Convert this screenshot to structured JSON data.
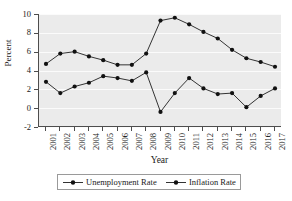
{
  "chart_data": {
    "type": "line",
    "title": "",
    "xlabel": "Year",
    "ylabel": "Percent",
    "categories": [
      "2001",
      "2002",
      "2003",
      "2004",
      "2005",
      "2006",
      "2007",
      "2008",
      "2009",
      "2010",
      "2011",
      "2012",
      "2013",
      "2014",
      "2015",
      "2016",
      "2017"
    ],
    "x": [
      2001,
      2002,
      2003,
      2004,
      2005,
      2006,
      2007,
      2008,
      2009,
      2010,
      2011,
      2012,
      2013,
      2014,
      2015,
      2016,
      2017
    ],
    "series": [
      {
        "name": "Unemployment Rate",
        "color": "#333333",
        "marker": "circle",
        "values": [
          4.7,
          5.8,
          6.0,
          5.5,
          5.1,
          4.6,
          4.6,
          5.8,
          9.3,
          9.6,
          8.9,
          8.1,
          7.4,
          6.2,
          5.3,
          4.9,
          4.4
        ]
      },
      {
        "name": "Inflation Rate",
        "color": "#333333",
        "marker": "circle",
        "values": [
          2.8,
          1.6,
          2.3,
          2.7,
          3.4,
          3.2,
          2.9,
          3.8,
          -0.4,
          1.6,
          3.2,
          2.1,
          1.5,
          1.6,
          0.1,
          1.3,
          2.1
        ]
      }
    ],
    "ylim": [
      -2,
      10
    ],
    "yticks": [
      -2,
      0,
      2,
      4,
      6,
      8,
      10
    ],
    "ytick_labels": [
      "-2",
      "0",
      "2",
      "4",
      "6",
      "8",
      "10"
    ],
    "grid": true,
    "grid_axis": "y",
    "legend_position": "bottom",
    "plot_background": "#ebebeb",
    "gridline_color": "#fbfbfb",
    "axis_color": "#4d4d4d"
  },
  "legend": {
    "entries": [
      {
        "label": "Unemployment Rate"
      },
      {
        "label": "Inflation Rate"
      }
    ]
  },
  "axes": {
    "y_title": "Percent",
    "x_title": "Year"
  }
}
